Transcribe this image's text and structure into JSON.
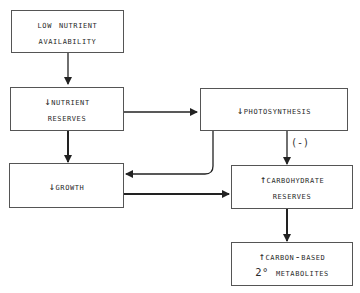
{
  "nodes": {
    "low_nutrient": {
      "line1": "Low nutrient",
      "line2": "availability"
    },
    "nutrient_reserves": {
      "line1": "↓Nutrient",
      "line2": "reserves"
    },
    "photosynthesis": {
      "line1": "↓Photosynthesis"
    },
    "growth": {
      "line1": "↓Growth"
    },
    "carbohydrate_reserves": {
      "line1": "↑Carbohydrate",
      "line2": "reserves"
    },
    "secondary_metabolites": {
      "line1": "↑Carbon-based",
      "line2": "2° metabolites"
    }
  },
  "edges": {
    "photosynthesis_to_carbohydrate_label": "(-)"
  }
}
